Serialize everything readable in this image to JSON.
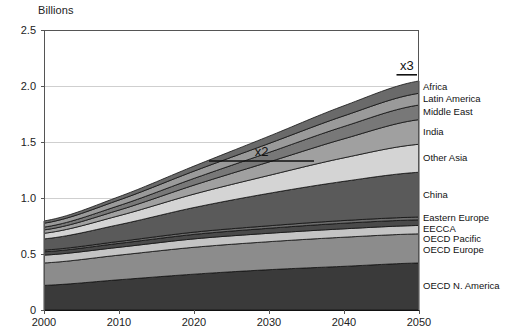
{
  "chart_data": {
    "type": "area",
    "title": "",
    "ylabel": "Billions",
    "xlabel": "",
    "x": [
      2000,
      2010,
      2020,
      2030,
      2040,
      2050
    ],
    "xlim": [
      2000,
      2050
    ],
    "ylim": [
      0,
      2.5
    ],
    "xticks": [
      "2000",
      "2010",
      "2020",
      "2030",
      "2040",
      "2050"
    ],
    "yticks": [
      "0",
      "0.5",
      "1.0",
      "1.5",
      "2.0",
      "2.5"
    ],
    "grid": "horizontal",
    "legend_position": "right-inline",
    "stacked": true,
    "series": [
      {
        "name": "OECD N. America",
        "color": "#3a3a3a",
        "values": [
          0.22,
          0.27,
          0.32,
          0.36,
          0.39,
          0.42
        ]
      },
      {
        "name": "OECD Europe",
        "color": "#8c8c8c",
        "values": [
          0.2,
          0.22,
          0.24,
          0.25,
          0.26,
          0.26
        ]
      },
      {
        "name": "OECD Pacific",
        "color": "#c4c4c4",
        "values": [
          0.07,
          0.07,
          0.075,
          0.075,
          0.075,
          0.075
        ]
      },
      {
        "name": "EECCA",
        "color": "#4a4a4a",
        "values": [
          0.03,
          0.035,
          0.04,
          0.045,
          0.05,
          0.05
        ]
      },
      {
        "name": "Eastern Europe",
        "color": "#6e6e6e",
        "values": [
          0.015,
          0.017,
          0.02,
          0.022,
          0.024,
          0.025
        ]
      },
      {
        "name": "China",
        "color": "#5a5a5a",
        "values": [
          0.1,
          0.15,
          0.22,
          0.29,
          0.35,
          0.4
        ]
      },
      {
        "name": "Other Asia",
        "color": "#d4d4d4",
        "values": [
          0.05,
          0.08,
          0.12,
          0.16,
          0.21,
          0.25
        ]
      },
      {
        "name": "India",
        "color": "#a0a0a0",
        "values": [
          0.03,
          0.05,
          0.08,
          0.12,
          0.17,
          0.22
        ]
      },
      {
        "name": "Middle East",
        "color": "#787878",
        "values": [
          0.025,
          0.04,
          0.06,
          0.085,
          0.11,
          0.13
        ]
      },
      {
        "name": "Latin America",
        "color": "#9a9a9a",
        "values": [
          0.035,
          0.05,
          0.065,
          0.08,
          0.095,
          0.105
        ]
      },
      {
        "name": "Africa",
        "color": "#6a6a6a",
        "values": [
          0.02,
          0.03,
          0.045,
          0.065,
          0.09,
          0.11
        ]
      }
    ],
    "annotations": [
      {
        "label": "x2",
        "x_start": 2022,
        "x_end": 2036,
        "y": 1.33
      },
      {
        "label": "x3",
        "x_start": 2047,
        "x_end": 2062,
        "y": 2.1
      }
    ]
  },
  "axis_color": "#555555",
  "grid_color": "#cfcfcf"
}
